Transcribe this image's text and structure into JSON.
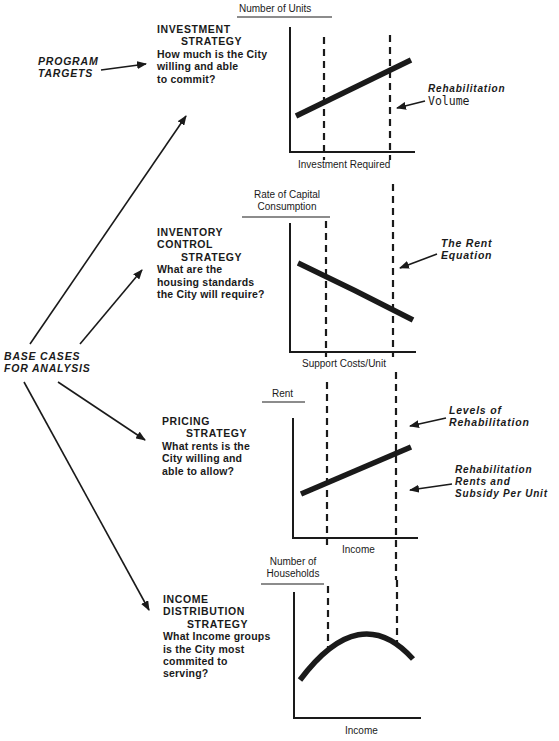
{
  "left_labels": {
    "program_targets": [
      "PROGRAM",
      "TARGETS"
    ],
    "base_cases": [
      "BASE CASES",
      "FOR ANALYSIS"
    ]
  },
  "strategies": [
    {
      "id": "investment",
      "title": [
        "INVESTMENT",
        "STRATEGY"
      ],
      "question": [
        "How much is the City",
        "willing and able",
        "to commit?"
      ]
    },
    {
      "id": "inventory_control",
      "title": [
        "INVENTORY",
        "CONTROL",
        "STRATEGY"
      ],
      "question": [
        "What are the",
        "housing standards",
        "the City will require?"
      ]
    },
    {
      "id": "pricing",
      "title": [
        "PRICING",
        "STRATEGY"
      ],
      "question": [
        "What rents is the",
        "City willing and",
        "able to allow?"
      ]
    },
    {
      "id": "income_distribution",
      "title": [
        "INCOME",
        "DISTRIBUTION",
        "STRATEGY"
      ],
      "question": [
        "What Income groups",
        "is the City most",
        "commited to",
        "serving?"
      ]
    }
  ],
  "charts": [
    {
      "ylabel": [
        "Number of Units"
      ],
      "xlabel": "Investment Required",
      "curve": "rising-line"
    },
    {
      "ylabel": [
        "Rate of Capital",
        "Consumption"
      ],
      "xlabel": "Support Costs/Unit",
      "curve": "declining-curve"
    },
    {
      "ylabel": [
        "Rent"
      ],
      "xlabel": "Income",
      "curve": "rising-line"
    },
    {
      "ylabel": [
        "Number of",
        "Households"
      ],
      "xlabel": "Income",
      "curve": "inverted-u"
    }
  ],
  "annotations": {
    "rehab_volume": [
      "Rehabilitation",
      "Volume"
    ],
    "rent_equation": [
      "The Rent",
      "Equation"
    ],
    "levels_of_rehab": [
      "Levels of",
      "Rehabilitation"
    ],
    "rehab_rents": [
      "Rehabilitation",
      "Rents and",
      "Subsidy Per Unit"
    ]
  },
  "colors": {
    "ink": "#1a1a1a",
    "background": "#ffffff"
  }
}
